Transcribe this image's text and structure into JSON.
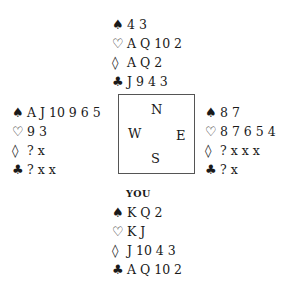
{
  "compass": {
    "north": "N",
    "west": "W",
    "east": "E",
    "south": "S"
  },
  "suits": {
    "spades": "♠",
    "hearts": "♡",
    "diamonds": "◊",
    "clubs": "♣"
  },
  "hands": {
    "north": {
      "label": "",
      "spades": "4 3",
      "hearts": "A Q 10 2",
      "diamonds": "A Q 2",
      "clubs": "J 9 4 3"
    },
    "west": {
      "label": "",
      "spades": "A J 10 9 6 5",
      "hearts": "9 3",
      "diamonds": "? x",
      "clubs": "? x x"
    },
    "east": {
      "label": "",
      "spades": "8 7",
      "hearts": "8 7 6 5 4",
      "diamonds": "? x x x",
      "clubs": "? x"
    },
    "south": {
      "label": "YOU",
      "spades": "K Q 2",
      "hearts": "K J",
      "diamonds": "J 10 4 3",
      "clubs": "A Q 10 2"
    }
  }
}
